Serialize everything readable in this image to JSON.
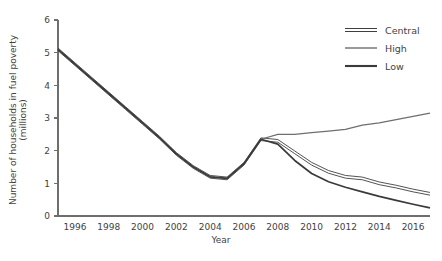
{
  "chart_data": {
    "type": "line",
    "title": "",
    "xlabel": "Year",
    "ylabel": "Number of households in fuel poverty (millions)",
    "xlim": [
      1995,
      2017
    ],
    "ylim": [
      0,
      6
    ],
    "grid": false,
    "legend_position": "top-right",
    "x_ticks": [
      "1996",
      "1998",
      "2000",
      "2002",
      "2004",
      "2006",
      "2008",
      "2010",
      "2012",
      "2014",
      "2016"
    ],
    "x_tick_values": [
      1996,
      1998,
      2000,
      2002,
      2004,
      2006,
      2008,
      2010,
      2012,
      2014,
      2016
    ],
    "y_ticks": [
      "0",
      "1",
      "2",
      "3",
      "4",
      "5",
      "6"
    ],
    "y_tick_values": [
      0,
      1,
      2,
      3,
      4,
      5,
      6
    ],
    "x": [
      1995,
      1996,
      1997,
      1998,
      1999,
      2000,
      2001,
      2002,
      2003,
      2004,
      2005,
      2006,
      2007,
      2008,
      2009,
      2010,
      2011,
      2012,
      2013,
      2014,
      2015,
      2016,
      2017
    ],
    "series": [
      {
        "name": "Central",
        "color": "#3f3f3f",
        "style": "double",
        "values": [
          5.1,
          4.65,
          4.2,
          3.75,
          3.3,
          2.85,
          2.4,
          1.9,
          1.5,
          1.2,
          1.15,
          1.6,
          2.35,
          2.3,
          1.95,
          1.6,
          1.35,
          1.2,
          1.15,
          1.0,
          0.9,
          0.78,
          0.68
        ]
      },
      {
        "name": "High",
        "color": "#6e6e6e",
        "style": "thin",
        "values": [
          5.1,
          4.65,
          4.2,
          3.75,
          3.3,
          2.85,
          2.4,
          1.9,
          1.5,
          1.2,
          1.15,
          1.6,
          2.35,
          2.5,
          2.5,
          2.55,
          2.6,
          2.65,
          2.78,
          2.85,
          2.95,
          3.05,
          3.15
        ]
      },
      {
        "name": "Low",
        "color": "#3a3a3a",
        "style": "thick",
        "values": [
          5.1,
          4.65,
          4.2,
          3.75,
          3.3,
          2.85,
          2.4,
          1.9,
          1.5,
          1.2,
          1.15,
          1.6,
          2.35,
          2.2,
          1.7,
          1.3,
          1.05,
          0.88,
          0.74,
          0.6,
          0.48,
          0.36,
          0.25
        ]
      }
    ],
    "legend": [
      {
        "label": "Central",
        "style": "double",
        "color": "#3f3f3f"
      },
      {
        "label": "High",
        "style": "thin",
        "color": "#6e6e6e"
      },
      {
        "label": "Low",
        "style": "thick",
        "color": "#3a3a3a"
      }
    ]
  }
}
